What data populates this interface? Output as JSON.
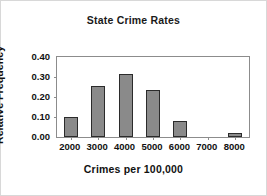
{
  "figure": {
    "background": "#ffffff",
    "border_color": "#d8d8d8"
  },
  "chart_data": {
    "type": "bar",
    "title": "State Crime Rates",
    "xlabel": "Crimes per 100,000",
    "ylabel": "Relative Frequency",
    "categories": [
      "2000",
      "3000",
      "4000",
      "5000",
      "6000",
      "7000",
      "8000"
    ],
    "values": [
      0.1,
      0.255,
      0.315,
      0.235,
      0.08,
      0.0,
      0.02
    ],
    "xtick_labels": [
      "2000",
      "3000",
      "4000",
      "5000",
      "6000",
      "7000",
      "8000"
    ],
    "ytick_labels": [
      "0.00",
      "0.10",
      "0.20",
      "0.30",
      "0.40"
    ],
    "ytick_values": [
      0.0,
      0.1,
      0.2,
      0.3,
      0.4
    ],
    "ylim": [
      0.0,
      0.4
    ],
    "grid": false,
    "legend": null,
    "bar_fill_color": "#8a8a8a",
    "bar_edge_color": "#2b2b2b",
    "axis_color": "#8c8c8c",
    "text_color": "#111111"
  }
}
